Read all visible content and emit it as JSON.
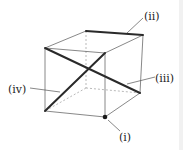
{
  "figure": {
    "type": "cube-diagram",
    "labels": {
      "i": "(i)",
      "ii": "(ii)",
      "iii": "(iii)",
      "iv": "(iv)"
    },
    "highlighted_elements": [
      {
        "label": "(i)",
        "kind": "vertex",
        "description": "bottom-front-right vertex"
      },
      {
        "label": "(ii)",
        "kind": "edge",
        "description": "top-back edge"
      },
      {
        "label": "(iii)",
        "kind": "face-diagonal",
        "description": "diagonal from top-front-left to bottom-back-right"
      },
      {
        "label": "(iv)",
        "kind": "face-diagonal",
        "description": "diagonal from bottom-front-left to top-front-right"
      }
    ],
    "colors": {
      "edge": "#6a6a6a",
      "bold": "#2a2a2a",
      "background": "#ffffff"
    }
  }
}
